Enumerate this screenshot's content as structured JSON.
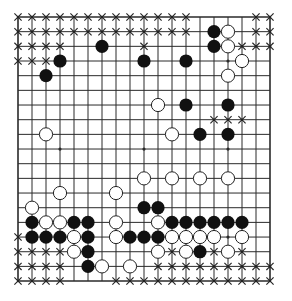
{
  "diagram": {
    "type": "go-board",
    "size": 19,
    "geometry": {
      "origin_x": 18,
      "origin_y": 17,
      "spacing_x": 14.0,
      "spacing_y": 14.67,
      "stone_radius": 6.6
    },
    "colors": {
      "line": "#2a2a2a",
      "black_stone": "#111111",
      "white_stone": "#ffffff",
      "white_outline": "#222222",
      "mark": "#222222",
      "background": "#ffffff"
    },
    "star_points": [
      [
        15,
        3
      ],
      [
        3,
        9
      ],
      [
        9,
        9
      ],
      [
        15,
        9
      ],
      [
        15,
        15
      ]
    ],
    "black_stones": [
      [
        14,
        1
      ],
      [
        6,
        2
      ],
      [
        14,
        2
      ],
      [
        3,
        3
      ],
      [
        9,
        3
      ],
      [
        12,
        3
      ],
      [
        2,
        4
      ],
      [
        12,
        6
      ],
      [
        15,
        6
      ],
      [
        13,
        8
      ],
      [
        15,
        8
      ],
      [
        9,
        13
      ],
      [
        10,
        13
      ],
      [
        1,
        14
      ],
      [
        4,
        14
      ],
      [
        5,
        14
      ],
      [
        11,
        14
      ],
      [
        12,
        14
      ],
      [
        13,
        14
      ],
      [
        14,
        14
      ],
      [
        15,
        14
      ],
      [
        16,
        14
      ],
      [
        1,
        15
      ],
      [
        2,
        15
      ],
      [
        3,
        15
      ],
      [
        5,
        15
      ],
      [
        8,
        15
      ],
      [
        9,
        15
      ],
      [
        10,
        15
      ],
      [
        5,
        16
      ],
      [
        13,
        16
      ],
      [
        5,
        17
      ]
    ],
    "white_stones": [
      [
        15,
        1
      ],
      [
        15,
        2
      ],
      [
        16,
        3
      ],
      [
        15,
        4
      ],
      [
        10,
        6
      ],
      [
        2,
        8
      ],
      [
        11,
        8
      ],
      [
        9,
        11
      ],
      [
        11,
        11
      ],
      [
        13,
        11
      ],
      [
        15,
        11
      ],
      [
        3,
        12
      ],
      [
        7,
        12
      ],
      [
        1,
        13
      ],
      [
        2,
        14
      ],
      [
        3,
        14
      ],
      [
        7,
        14
      ],
      [
        10,
        14
      ],
      [
        4,
        15
      ],
      [
        7,
        15
      ],
      [
        11,
        15
      ],
      [
        12,
        15
      ],
      [
        13,
        15
      ],
      [
        14,
        15
      ],
      [
        16,
        15
      ],
      [
        4,
        16
      ],
      [
        10,
        16
      ],
      [
        12,
        16
      ],
      [
        15,
        16
      ],
      [
        6,
        17
      ],
      [
        8,
        17
      ]
    ],
    "x_marks": [
      [
        0,
        0
      ],
      [
        1,
        0
      ],
      [
        2,
        0
      ],
      [
        3,
        0
      ],
      [
        4,
        0
      ],
      [
        5,
        0
      ],
      [
        6,
        0
      ],
      [
        7,
        0
      ],
      [
        8,
        0
      ],
      [
        9,
        0
      ],
      [
        10,
        0
      ],
      [
        11,
        0
      ],
      [
        12,
        0
      ],
      [
        17,
        0
      ],
      [
        18,
        0
      ],
      [
        0,
        1
      ],
      [
        1,
        1
      ],
      [
        2,
        1
      ],
      [
        3,
        1
      ],
      [
        4,
        1
      ],
      [
        5,
        1
      ],
      [
        6,
        1
      ],
      [
        7,
        1
      ],
      [
        8,
        1
      ],
      [
        9,
        1
      ],
      [
        10,
        1
      ],
      [
        11,
        1
      ],
      [
        12,
        1
      ],
      [
        17,
        1
      ],
      [
        18,
        1
      ],
      [
        0,
        2
      ],
      [
        1,
        2
      ],
      [
        2,
        2
      ],
      [
        3,
        2
      ],
      [
        9,
        2
      ],
      [
        16,
        2
      ],
      [
        17,
        2
      ],
      [
        18,
        2
      ],
      [
        0,
        3
      ],
      [
        1,
        3
      ],
      [
        2,
        3
      ],
      [
        14,
        7
      ],
      [
        15,
        7
      ],
      [
        16,
        7
      ],
      [
        0,
        15
      ],
      [
        0,
        16
      ],
      [
        1,
        16
      ],
      [
        2,
        16
      ],
      [
        3,
        16
      ],
      [
        11,
        16
      ],
      [
        14,
        16
      ],
      [
        16,
        16
      ],
      [
        0,
        17
      ],
      [
        1,
        17
      ],
      [
        2,
        17
      ],
      [
        3,
        17
      ],
      [
        10,
        17
      ],
      [
        11,
        17
      ],
      [
        12,
        17
      ],
      [
        13,
        17
      ],
      [
        14,
        17
      ],
      [
        15,
        17
      ],
      [
        16,
        17
      ],
      [
        17,
        17
      ],
      [
        18,
        17
      ],
      [
        0,
        18
      ],
      [
        1,
        18
      ],
      [
        2,
        18
      ],
      [
        3,
        18
      ],
      [
        7,
        18
      ],
      [
        8,
        18
      ],
      [
        9,
        18
      ],
      [
        10,
        18
      ],
      [
        11,
        18
      ],
      [
        12,
        18
      ],
      [
        13,
        18
      ],
      [
        14,
        18
      ],
      [
        15,
        18
      ],
      [
        16,
        18
      ],
      [
        17,
        18
      ],
      [
        18,
        18
      ]
    ]
  }
}
